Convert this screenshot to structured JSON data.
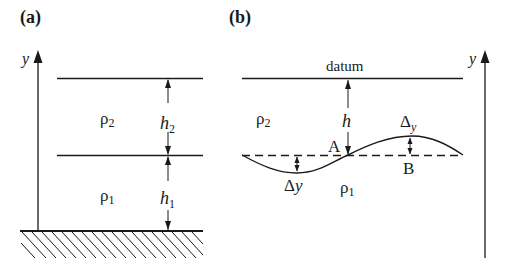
{
  "panel_a": {
    "label": "(a)",
    "axis_label": "y",
    "upper_fluid_density": "ρ",
    "upper_fluid_density_sub": "2",
    "lower_fluid_density": "ρ",
    "lower_fluid_density_sub": "1",
    "upper_layer_height": "h",
    "upper_layer_height_sub": "2",
    "lower_layer_height": "h",
    "lower_layer_height_sub": "1"
  },
  "panel_b": {
    "label": "(b)",
    "axis_label": "y",
    "datum_label": "datum",
    "upper_fluid_density": "ρ",
    "upper_fluid_density_sub": "2",
    "lower_fluid_density": "ρ",
    "lower_fluid_density_sub": "1",
    "depth_label": "h",
    "point_a": "A",
    "point_b": "B",
    "crest_displacement": "Δ",
    "crest_displacement_sub": "y",
    "trough_displacement": "Δy"
  },
  "colors": {
    "ink": "#1a1a1a",
    "background": "#ffffff"
  }
}
